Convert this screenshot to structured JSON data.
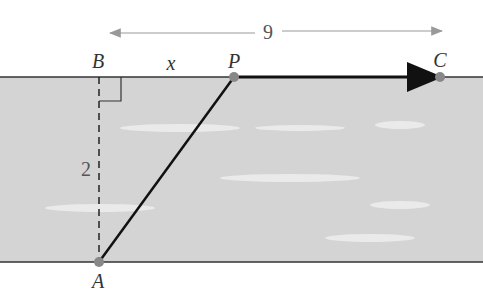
{
  "diagram": {
    "points": {
      "A": "A",
      "B": "B",
      "P": "P",
      "C": "C"
    },
    "labels": {
      "width": "9",
      "offset": "x",
      "height": "2"
    },
    "colors": {
      "river": "#d4d4d4",
      "shore": "#333333",
      "point": "#888888",
      "arrow": "#999999"
    }
  }
}
